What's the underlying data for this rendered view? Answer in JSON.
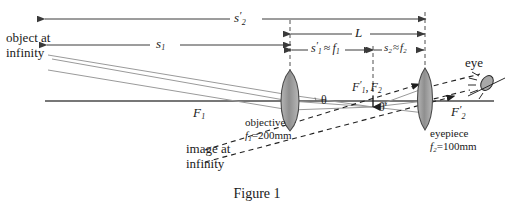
{
  "figure": {
    "caption": "Figure 1",
    "dimension_labels": {
      "s2_prime": {
        "base": "s",
        "sub": "2",
        "prime": "′"
      },
      "s1": {
        "base": "s",
        "sub": "1",
        "prime": ""
      },
      "s1_prime_approx_f1": {
        "text_base": "s",
        "sub": "1",
        "prime": "′",
        "approx": "≈",
        "f_base": "f",
        "f_sub": "1"
      },
      "s2_approx_f2": {
        "text_base": "s",
        "sub": "2",
        "approx": "≈",
        "f_base": "f",
        "f_sub": "2"
      },
      "L": {
        "text": "L"
      }
    },
    "point_labels": {
      "F1": {
        "base": "F",
        "sub": "1",
        "prime": ""
      },
      "F1_prime_F2": {
        "first_base": "F",
        "first_sub": "1",
        "first_prime": "′",
        "separator": ",",
        "second_base": "F",
        "second_sub": "2"
      },
      "F2_prime": {
        "base": "F",
        "sub": "2",
        "prime": "′"
      }
    },
    "angle_labels": {
      "theta": "θ",
      "theta_prime": "θ′"
    },
    "text_labels": {
      "object_at_infinity_line1": "object at",
      "object_at_infinity_line2": "infinity",
      "image_at_infinity_line1": "image at",
      "image_at_infinity_line2": "infinity",
      "eye": "eye",
      "objective": "objective",
      "eyepiece": "eyepiece"
    },
    "lens_specs": {
      "objective_focal": {
        "symbol": "f",
        "sub": "1",
        "equals": "=",
        "value": "200mm"
      },
      "eyepiece_focal": {
        "symbol": "f",
        "sub": "2",
        "equals": "=",
        "value": "100mm"
      }
    },
    "colors": {
      "line": "#3a3a3a",
      "ray_light": "#8c8c8c",
      "lens_fill": "#9c9c9c",
      "lens_stroke": "#4a4a4a",
      "text": "#1a1a1a",
      "background": "#ffffff"
    },
    "geometry": {
      "optical_axis_y": 101,
      "objective_x": 290,
      "eyepiece_x": 425,
      "focal_common_x": 373,
      "F1_x": 197
    }
  }
}
